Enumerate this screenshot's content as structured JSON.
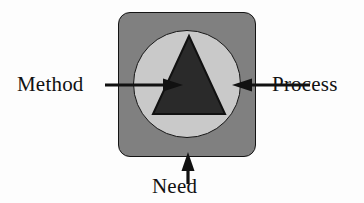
{
  "diagram": {
    "shapes": {
      "outer_square": {
        "name": "rounded-square",
        "fill": "#808080",
        "stroke": "#141414"
      },
      "inner_circle": {
        "name": "circle",
        "fill": "#c9c9c9",
        "stroke": "#141414"
      },
      "triangle": {
        "name": "triangle",
        "fill": "#2a2a2a",
        "stroke": "#111111"
      }
    },
    "labels": {
      "method": "Method",
      "process": "Process",
      "need": "Need"
    },
    "arrows": {
      "method_arrow": "arrow-right",
      "process_arrow": "arrow-left",
      "need_arrow": "arrow-up"
    },
    "colors": {
      "square_gray": "#808080",
      "circle_gray": "#c9c9c9",
      "triangle_dark": "#2a2a2a",
      "ink": "#111111",
      "background": "#fdfdfd"
    }
  }
}
